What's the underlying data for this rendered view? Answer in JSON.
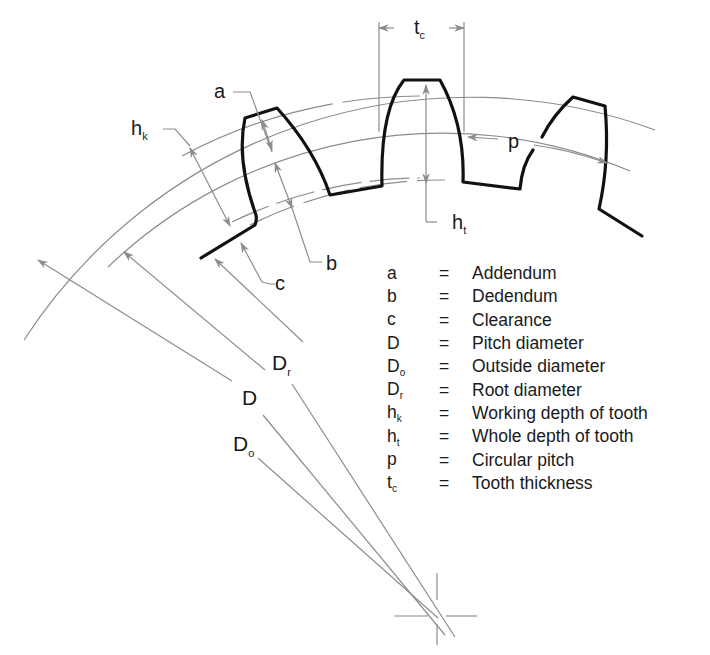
{
  "diagram": {
    "labels": {
      "a": "a",
      "b": "b",
      "c": "c",
      "hk": {
        "base": "h",
        "sub": "k"
      },
      "ht": {
        "base": "h",
        "sub": "t"
      },
      "tc": {
        "base": "t",
        "sub": "c"
      },
      "p": "p",
      "D": "D",
      "Dr": {
        "base": "D",
        "sub": "r"
      },
      "Do": {
        "base": "D",
        "sub": "o"
      }
    },
    "colors": {
      "tooth_outline": "#111111",
      "construction_lines": "#8c8c8c",
      "text": "#1a1a1a",
      "background": "#ffffff"
    }
  },
  "legend": {
    "items": [
      {
        "symbol": "a",
        "sub": "",
        "eq": "=",
        "meaning": "Addendum"
      },
      {
        "symbol": "b",
        "sub": "",
        "eq": "=",
        "meaning": "Dedendum"
      },
      {
        "symbol": "c",
        "sub": "",
        "eq": "=",
        "meaning": "Clearance"
      },
      {
        "symbol": "D",
        "sub": "",
        "eq": "=",
        "meaning": "Pitch diameter"
      },
      {
        "symbol": "D",
        "sub": "o",
        "eq": "=",
        "meaning": "Outside diameter"
      },
      {
        "symbol": "D",
        "sub": "r",
        "eq": "=",
        "meaning": "Root diameter"
      },
      {
        "symbol": "h",
        "sub": "k",
        "eq": "=",
        "meaning": "Working depth of tooth"
      },
      {
        "symbol": "h",
        "sub": "t",
        "eq": "=",
        "meaning": "Whole depth of tooth"
      },
      {
        "symbol": "p",
        "sub": "",
        "eq": "=",
        "meaning": "Circular pitch"
      },
      {
        "symbol": "t",
        "sub": "c",
        "eq": "=",
        "meaning": "Tooth thickness"
      }
    ]
  }
}
